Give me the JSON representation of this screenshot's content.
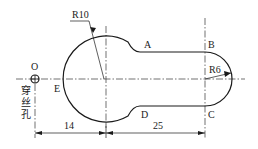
{
  "drawing": {
    "points": {
      "O": "O",
      "A": "A",
      "B": "B",
      "C": "C",
      "D": "D",
      "E": "E"
    },
    "radii": {
      "large": "R10",
      "small": "R6"
    },
    "dimensions": {
      "left": "14",
      "right": "25"
    },
    "hole_label": [
      "穿",
      "丝",
      "孔"
    ]
  }
}
